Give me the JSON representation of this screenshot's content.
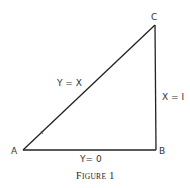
{
  "figure": {
    "caption_first": "F",
    "caption_rest": "IGURE",
    "caption_number": "1",
    "caption_full": "FIGURE 1",
    "stroke_color": "#222222",
    "text_color": "#333333"
  },
  "vertices": {
    "A": {
      "label": "A",
      "x": 23,
      "y": 150
    },
    "B": {
      "label": "B",
      "x": 156,
      "y": 150
    },
    "C": {
      "label": "C",
      "x": 155,
      "y": 25
    }
  },
  "edges": {
    "AC": {
      "label": "Y = X",
      "from": "A",
      "to": "C"
    },
    "BC": {
      "label": "X = I",
      "from": "B",
      "to": "C"
    },
    "AB": {
      "label": "Y= 0",
      "from": "A",
      "to": "B"
    }
  }
}
